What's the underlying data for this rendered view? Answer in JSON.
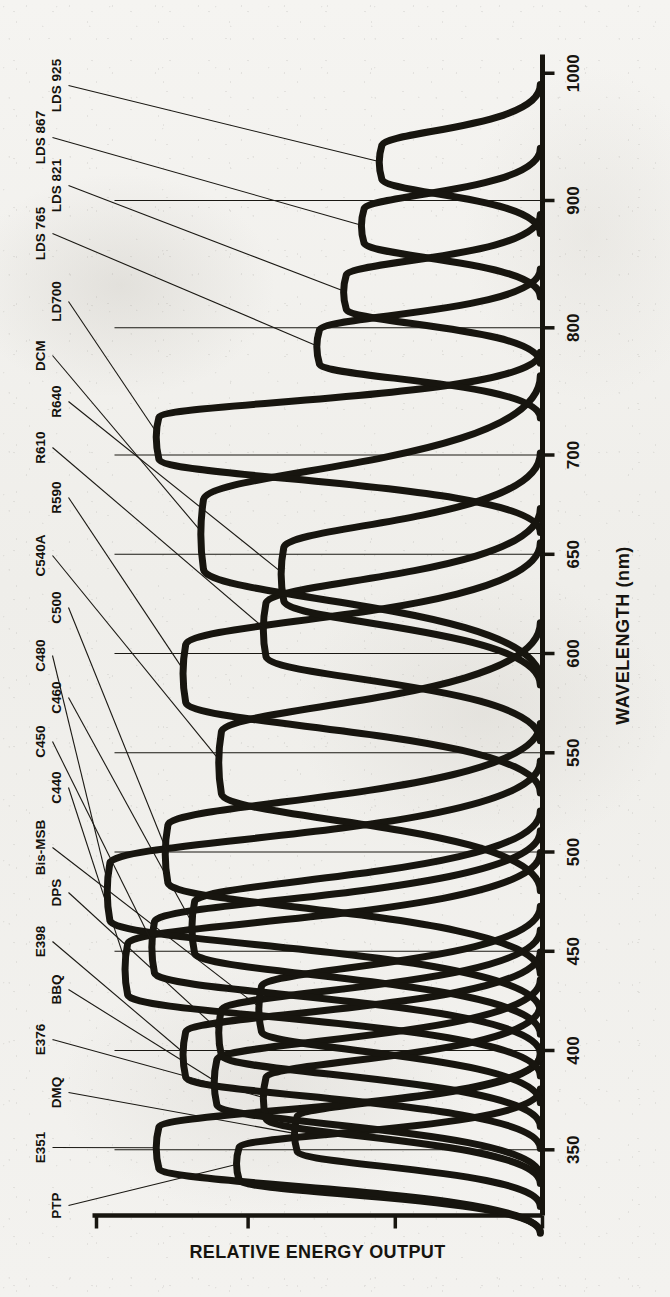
{
  "figure": {
    "orientation": "rotated-90-ccw",
    "ink_color": "#17150f",
    "paper_color": "#f2f1ee"
  },
  "chart_data": {
    "type": "line",
    "title": "",
    "xlabel": "WAVELENGTH (nm)",
    "ylabel": "RELATIVE ENERGY OUTPUT",
    "xlim": [
      330,
      1010
    ],
    "ylim": [
      0,
      1.0
    ],
    "grid": true,
    "legend": "inline-annotations",
    "xticks": [
      350,
      400,
      450,
      500,
      550,
      600,
      650,
      700,
      800,
      900,
      1000
    ],
    "xticklabels": [
      "350",
      "400",
      "450",
      "500",
      "550",
      "600",
      "650",
      "700",
      "800",
      "900",
      "1000"
    ],
    "yticks": [
      0,
      0.33,
      0.66,
      1.0
    ],
    "yticklabels": [
      "",
      "",
      "",
      ""
    ],
    "xscale_note": "compressed above 700 nm",
    "series": [
      {
        "name": "PTP",
        "label": "PTP",
        "peak_nm": 343,
        "peak_rel": 0.68,
        "width_nm": 16
      },
      {
        "name": "DMQ",
        "label": "DMQ",
        "peak_nm": 358,
        "peak_rel": 0.55,
        "width_nm": 17
      },
      {
        "name": "E351",
        "label": "E351",
        "peak_nm": 351,
        "peak_rel": 0.86,
        "width_nm": 20
      },
      {
        "name": "E376",
        "label": "E376",
        "peak_nm": 376,
        "peak_rel": 0.62,
        "width_nm": 20
      },
      {
        "name": "BBQ",
        "label": "BBQ",
        "peak_nm": 384,
        "peak_rel": 0.73,
        "width_nm": 22
      },
      {
        "name": "E398",
        "label": "E398",
        "peak_nm": 398,
        "peak_rel": 0.8,
        "width_nm": 22
      },
      {
        "name": "DPS",
        "label": "DPS",
        "peak_nm": 409,
        "peak_rel": 0.72,
        "width_nm": 22
      },
      {
        "name": "Bis-MSB",
        "label": "Bis-MSB",
        "peak_nm": 421,
        "peak_rel": 0.63,
        "width_nm": 22
      },
      {
        "name": "C440",
        "label": "C440",
        "peak_nm": 441,
        "peak_rel": 0.93,
        "width_nm": 25
      },
      {
        "name": "C450",
        "label": "C450",
        "peak_nm": 452,
        "peak_rel": 0.87,
        "width_nm": 25
      },
      {
        "name": "C460",
        "label": "C460",
        "peak_nm": 462,
        "peak_rel": 0.78,
        "width_nm": 25
      },
      {
        "name": "C480",
        "label": "C480",
        "peak_nm": 480,
        "peak_rel": 0.97,
        "width_nm": 28
      },
      {
        "name": "C500",
        "label": "C500",
        "peak_nm": 499,
        "peak_rel": 0.84,
        "width_nm": 28
      },
      {
        "name": "C540A",
        "label": "C540A",
        "peak_nm": 545,
        "peak_rel": 0.72,
        "width_nm": 30
      },
      {
        "name": "R590",
        "label": "R590",
        "peak_nm": 590,
        "peak_rel": 0.8,
        "width_nm": 28
      },
      {
        "name": "R610",
        "label": "R610",
        "peak_nm": 612,
        "peak_rel": 0.62,
        "width_nm": 26
      },
      {
        "name": "R640",
        "label": "R640",
        "peak_nm": 640,
        "peak_rel": 0.58,
        "width_nm": 26
      },
      {
        "name": "DCM",
        "label": "DCM",
        "peak_nm": 660,
        "peak_rel": 0.76,
        "width_nm": 34
      },
      {
        "name": "LD700",
        "label": "LD700",
        "peak_nm": 715,
        "peak_rel": 0.86,
        "width_nm": 28
      },
      {
        "name": "LDS 765",
        "label": "LDS 765",
        "peak_nm": 785,
        "peak_rel": 0.5,
        "width_nm": 26
      },
      {
        "name": "LDS 821",
        "label": "LDS 821",
        "peak_nm": 828,
        "peak_rel": 0.44,
        "width_nm": 26
      },
      {
        "name": "LDS 867",
        "label": "LDS 867",
        "peak_nm": 880,
        "peak_rel": 0.4,
        "width_nm": 26
      },
      {
        "name": "LDS 925",
        "label": "LDS 925",
        "peak_nm": 930,
        "peak_rel": 0.36,
        "width_nm": 26
      }
    ]
  },
  "annotations": [
    {
      "id": "PTP",
      "text": "PTP"
    },
    {
      "id": "E351",
      "text": "E351"
    },
    {
      "id": "DMQ",
      "text": "DMQ"
    },
    {
      "id": "E376",
      "text": "E376"
    },
    {
      "id": "BBQ",
      "text": "BBQ"
    },
    {
      "id": "E398",
      "text": "E398"
    },
    {
      "id": "DPS",
      "text": "DPS"
    },
    {
      "id": "Bis-MSB",
      "text": "Bis-MSB"
    },
    {
      "id": "C440",
      "text": "C440"
    },
    {
      "id": "C450",
      "text": "C450"
    },
    {
      "id": "C460",
      "text": "C460"
    },
    {
      "id": "C480",
      "text": "C480"
    },
    {
      "id": "C500",
      "text": "C500"
    },
    {
      "id": "C540A",
      "text": "C540A"
    },
    {
      "id": "R590",
      "text": "R590"
    },
    {
      "id": "R610",
      "text": "R610"
    },
    {
      "id": "R640",
      "text": "R640"
    },
    {
      "id": "DCM",
      "text": "DCM"
    },
    {
      "id": "LD700",
      "text": "LD700"
    },
    {
      "id": "LDS765",
      "text": "LDS 765"
    },
    {
      "id": "LDS821",
      "text": "LDS 821"
    },
    {
      "id": "LDS867",
      "text": "LDS 867"
    },
    {
      "id": "LDS925",
      "text": "LDS 925"
    }
  ],
  "axis": {
    "x_title": "WAVELENGTH (nm)",
    "y_title": "RELATIVE ENERGY OUTPUT",
    "ticks": [
      "350",
      "400",
      "450",
      "500",
      "550",
      "600",
      "650",
      "700",
      "800",
      "900",
      "1000"
    ]
  }
}
